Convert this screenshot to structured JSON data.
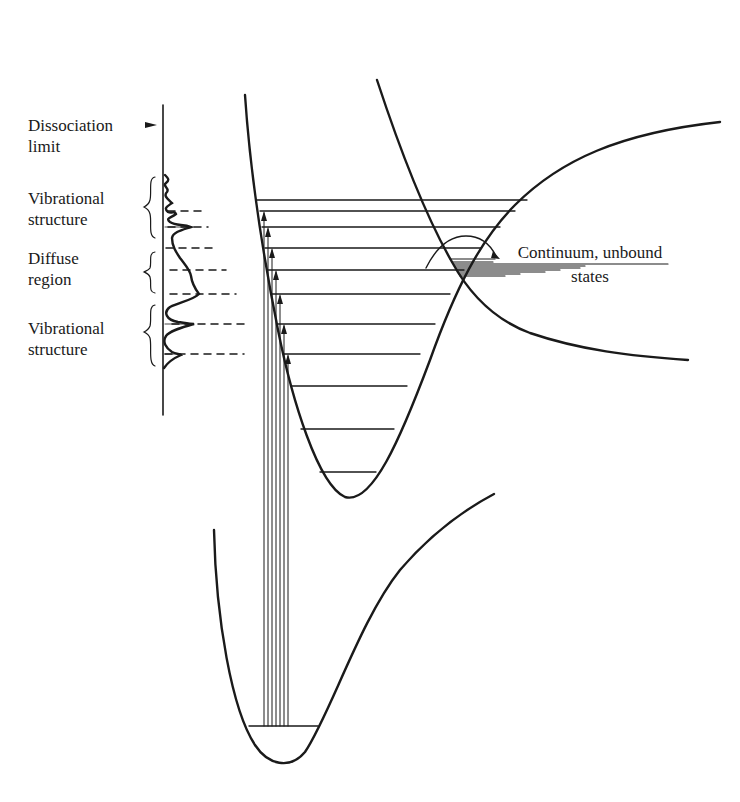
{
  "diagram": {
    "type": "potential-energy-diagram",
    "labels": {
      "dissociation_limit_line1": "Dissociation",
      "dissociation_limit_line2": "limit",
      "vibrational_structure_upper_line1": "Vibrational",
      "vibrational_structure_upper_line2": "structure",
      "diffuse_region_line1": "Diffuse",
      "diffuse_region_line2": "region",
      "vibrational_structure_lower_line1": "Vibrational",
      "vibrational_structure_lower_line2": "structure",
      "continuum_line1": "Continuum, unbound",
      "continuum_line2": "states"
    },
    "curves": [
      {
        "name": "ground-state-well",
        "levels_y": [
          726
        ]
      },
      {
        "name": "excited-bound-well",
        "levels_y": [
          200,
          211,
          227,
          248,
          270,
          294,
          324,
          354,
          386,
          429,
          472
        ]
      },
      {
        "name": "repulsive-state-curve"
      }
    ],
    "absorption_transitions": 7,
    "spectrum_dashed_levels_y": [
      211,
      227,
      248,
      270,
      294,
      324,
      354
    ],
    "colors": {
      "ink": "#1a1a1a",
      "background": "#ffffff"
    }
  }
}
